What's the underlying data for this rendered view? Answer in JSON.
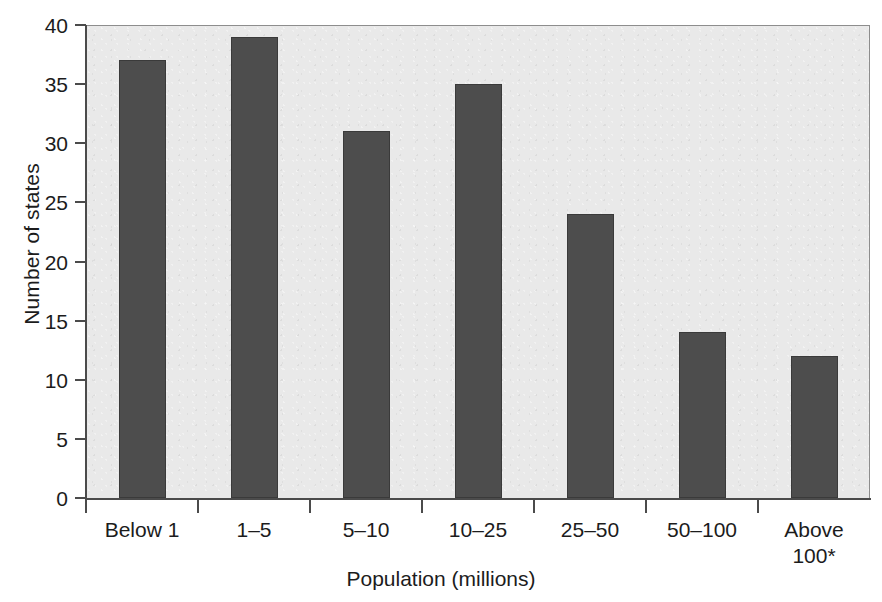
{
  "chart_data": {
    "type": "bar",
    "title": "",
    "categories": [
      "Below 1",
      "1–5",
      "5–10",
      "10–25",
      "25–50",
      "50–100",
      "Above\n100*"
    ],
    "values": [
      37,
      39,
      31,
      35,
      24,
      14,
      12
    ],
    "xlabel": "Population (millions)",
    "ylabel": "Number of states",
    "ylim": [
      0,
      40
    ],
    "ytick_values": [
      0,
      5,
      10,
      15,
      20,
      25,
      30,
      35,
      40
    ],
    "ytick_labels": [
      "0",
      "5",
      "10",
      "15",
      "20",
      "25",
      "30",
      "35",
      "40"
    ],
    "grid": false,
    "legend": false,
    "legend_position": "none",
    "bar_color": "#4d4d4d",
    "plot_background": "#e9e9e9",
    "axis_color": "#4b4b4b",
    "text_color": "#1c1c1c",
    "footnote_marker": "*"
  },
  "axes": {
    "y_title": "Number of states",
    "x_title": "Population (millions)"
  },
  "x_labels": [
    {
      "line1": "Below 1",
      "line2": ""
    },
    {
      "line1": "1–5",
      "line2": ""
    },
    {
      "line1": "5–10",
      "line2": ""
    },
    {
      "line1": "10–25",
      "line2": ""
    },
    {
      "line1": "25–50",
      "line2": ""
    },
    {
      "line1": "50–100",
      "line2": ""
    },
    {
      "line1": "Above",
      "line2": "100*"
    }
  ]
}
